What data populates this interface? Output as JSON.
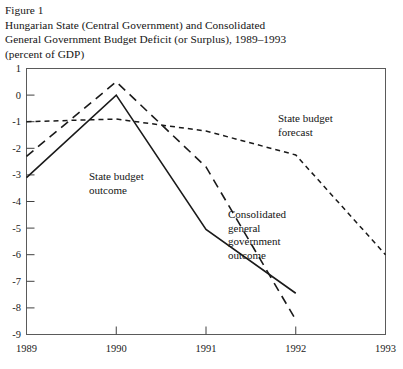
{
  "figure": {
    "number_label": "Figure 1",
    "title_line1": "Hungarian State (Central Government) and Consolidated",
    "title_line2": "General Government Budget Deficit (or Surplus), 1989–1993",
    "units_line": "(percent of GDP)"
  },
  "chart_data": {
    "type": "line",
    "title": "Hungarian State (Central Government) and Consolidated General Government Budget Deficit (or Surplus), 1989–1993",
    "subtitle": "(percent of GDP)",
    "xlabel": "",
    "ylabel": "",
    "categories": [
      "1989",
      "1990",
      "1991",
      "1992",
      "1993"
    ],
    "x_tick_labels": [
      "1989",
      "1990",
      "1991",
      "1992",
      "1993"
    ],
    "y_tick_labels": [
      "1",
      "0",
      "-1",
      "-2",
      "-3",
      "-4",
      "-5",
      "-6",
      "-7",
      "-8",
      "-9"
    ],
    "y_ticks": [
      1,
      0,
      -1,
      -2,
      -3,
      -4,
      -5,
      -6,
      -7,
      -8,
      -9
    ],
    "xlim": [
      1989,
      1993
    ],
    "ylim": [
      -9,
      1
    ],
    "grid": false,
    "legend_position": "inline-annotations",
    "series": [
      {
        "name": "State budget outcome",
        "style": "solid",
        "x": [
          1989,
          1990,
          1991,
          1992
        ],
        "values": [
          -3.1,
          0.0,
          -5.05,
          -7.45
        ]
      },
      {
        "name": "Consolidated general government outcome",
        "style": "long-dashed",
        "x": [
          1989,
          1990,
          1991,
          1992
        ],
        "values": [
          -2.3,
          0.5,
          -2.7,
          -8.45
        ]
      },
      {
        "name": "State budget forecast",
        "style": "short-dashed",
        "x": [
          1989,
          1990,
          1991,
          1992,
          1993
        ],
        "values": [
          -1.0,
          -0.9,
          -1.35,
          -2.25,
          -6.0
        ]
      }
    ],
    "annotations": [
      {
        "text": "State budget",
        "text2": "outcome",
        "series": "State budget outcome"
      },
      {
        "text": "State budget",
        "text2": "forecast",
        "series": "State budget forecast"
      },
      {
        "text": "Consolidated",
        "text2": "general",
        "text3": "government",
        "text4": "outcome",
        "series": "Consolidated general government outcome"
      }
    ],
    "colors": {
      "line": "#1a1a1a",
      "axis": "#404040",
      "background": "#ffffff"
    }
  },
  "labels": {
    "state_budget_outcome_l1": "State budget",
    "state_budget_outcome_l2": "outcome",
    "state_budget_forecast_l1": "State budget",
    "state_budget_forecast_l2": "forecast",
    "consolidated_l1": "Consolidated",
    "consolidated_l2": "general",
    "consolidated_l3": "government",
    "consolidated_l4": "outcome"
  },
  "axis": {
    "y": [
      "1",
      "0",
      "-1",
      "-2",
      "-3",
      "-4",
      "-5",
      "-6",
      "-7",
      "-8",
      "-9"
    ],
    "x": [
      "1989",
      "1990",
      "1991",
      "1992",
      "1993"
    ]
  }
}
